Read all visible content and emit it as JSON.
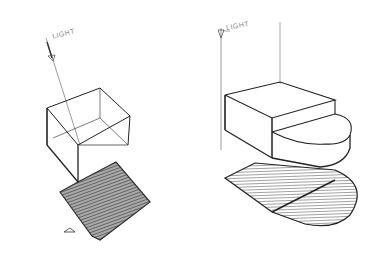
{
  "image": {
    "subject": "Hand-drawn pencil sketch of cast shadows from overhead light",
    "background": "#ffffff",
    "ink": "#222222"
  },
  "left_sketch": {
    "label": "LIGHT",
    "object": "box",
    "shadow": "parallelogram"
  },
  "right_sketch": {
    "label": "LIGHT",
    "object": "box with half-cylinder",
    "shadow": "rectangle with semicircle"
  }
}
